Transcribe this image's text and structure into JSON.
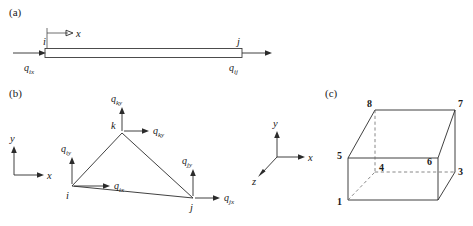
{
  "figure": {
    "line_color": "#2b2b2b",
    "dash_color": "#6a6a6a",
    "background": "#ffffff"
  },
  "panels": {
    "a": {
      "label": "(a)",
      "description": "one-dimensional bar element",
      "axis_x": "x",
      "node_i": "i",
      "node_j": "j",
      "flux_i": {
        "base": "q",
        "sub": "ix"
      },
      "flux_j": {
        "base": "q",
        "sub": "ij"
      }
    },
    "b": {
      "label": "(b)",
      "description": "two-dimensional triangular element",
      "axes": {
        "x": "x",
        "y": "y"
      },
      "nodes": [
        {
          "id": "i"
        },
        {
          "id": "j"
        },
        {
          "id": "k"
        }
      ],
      "fluxes": [
        {
          "base": "q",
          "sub": "iy",
          "node": "i",
          "direction": "up"
        },
        {
          "base": "q",
          "sub": "ix",
          "node": "i",
          "direction": "right"
        },
        {
          "base": "q",
          "sub": "ky",
          "node": "k",
          "direction": "up"
        },
        {
          "base": "q",
          "sub": "ky",
          "node": "k",
          "direction": "right"
        },
        {
          "base": "q",
          "sub": "jy",
          "node": "j",
          "direction": "up"
        },
        {
          "base": "q",
          "sub": "jx",
          "node": "j",
          "direction": "right"
        }
      ]
    },
    "triad": {
      "label_x": "x",
      "label_y": "y",
      "label_z": "z"
    },
    "c": {
      "label": "(c)",
      "description": "three-dimensional eight-node hexahedral element",
      "node_numbers": [
        "1",
        "2",
        "3",
        "4",
        "5",
        "6",
        "7",
        "8"
      ],
      "visible_numbers": [
        "8",
        "7",
        "4",
        "3",
        "5",
        "6",
        "1"
      ]
    }
  }
}
